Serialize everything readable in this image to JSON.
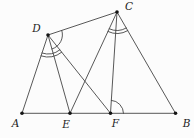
{
  "figure": {
    "background": "#fcfcfc",
    "stroke_color": "#454545",
    "dot_color": "#141414",
    "label_color": "#1c1c1c",
    "viewbox": {
      "width": 194,
      "height": 138
    },
    "dot_radius": 1.8,
    "points": {
      "A": {
        "label": "A",
        "x": 22,
        "y": 113.3,
        "lx": 15.5,
        "ly": 126.5
      },
      "E": {
        "label": "E",
        "x": 70,
        "y": 113.3,
        "lx": 66,
        "ly": 127.5
      },
      "F": {
        "label": "F",
        "x": 110.5,
        "y": 113.3,
        "lx": 115.5,
        "ly": 126.5
      },
      "B": {
        "label": "B",
        "x": 175.5,
        "y": 113.3,
        "lx": 186.5,
        "ly": 127
      },
      "D": {
        "label": "D",
        "x": 48,
        "y": 35,
        "lx": 36.5,
        "ly": 32
      },
      "C": {
        "label": "C",
        "x": 117,
        "y": 12,
        "lx": 129,
        "ly": 10
      }
    },
    "segments": [
      [
        "A",
        "B"
      ],
      [
        "A",
        "D"
      ],
      [
        "D",
        "E"
      ],
      [
        "D",
        "F"
      ],
      [
        "D",
        "C"
      ],
      [
        "E",
        "C"
      ],
      [
        "C",
        "F"
      ],
      [
        "C",
        "B"
      ]
    ],
    "angle_marks": [
      {
        "name": "angle-CDE",
        "vertex": "D",
        "ray_a": "C",
        "ray_b": "E",
        "radius": 14.5,
        "count": 1,
        "gap": 3
      },
      {
        "name": "angle-ADF",
        "vertex": "D",
        "ray_a": "F",
        "ray_b": "A",
        "radius": 19,
        "count": 2,
        "gap": 3
      },
      {
        "name": "angle-ECB",
        "vertex": "C",
        "ray_a": "B",
        "ray_b": "E",
        "radius": 18.5,
        "count": 2,
        "gap": 3
      },
      {
        "name": "angle-CFB",
        "vertex": "F",
        "ray_a": "C",
        "ray_b": "B",
        "radius": 13,
        "count": 1,
        "gap": 3
      }
    ]
  }
}
